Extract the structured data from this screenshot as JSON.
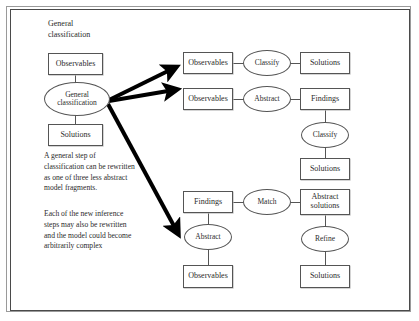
{
  "figure": {
    "background_color": "#ffffff",
    "stroke_color": "#555555",
    "arrow_color": "#000000",
    "width": 419,
    "height": 321
  },
  "left_column": {
    "heading": "General\nclassification",
    "heading_line1": "General",
    "heading_line2": "classification",
    "observables_label": "Observables",
    "ellipse_label_line1": "General",
    "ellipse_label_line2": "classification",
    "solutions_label": "Solutions",
    "paragraph_1": "A general step of classification can be rewritten as one of three less abstract model fragments.",
    "paragraph_2": "Each of the new inference steps may also be rewritten and the model could become arbitrarily complex"
  },
  "branch_1": {
    "observables_label": "Observables",
    "operator_label": "Classify",
    "solutions_label": "Solutions"
  },
  "branch_2": {
    "observables_label": "Observables",
    "operator_label": "Abstract",
    "findings_label": "Findings",
    "operator_2_label": "Classify",
    "solutions_label": "Solutions"
  },
  "branch_3": {
    "findings_label": "Findings",
    "operator_label": "Match",
    "abstract_solutions_line1": "Abstract",
    "abstract_solutions_line2": "solutions",
    "abstract_operator_label": "Abstract",
    "observables_label": "Observables",
    "refine_operator_label": "Refine",
    "solutions_label": "Solutions"
  },
  "arrows": {
    "count": 3,
    "arrow_1_name": "arrow-to-classify-branch",
    "arrow_2_name": "arrow-to-abstract-classify-branch",
    "arrow_3_name": "arrow-to-match-refine-branch"
  }
}
